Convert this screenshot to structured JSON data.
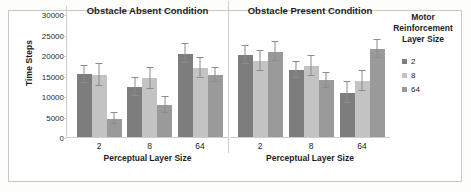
{
  "chart_data": {
    "type": "bar",
    "title": "",
    "xlabel": "Perceptual Layer Size",
    "ylabel": "Time Steps",
    "categories": [
      "2",
      "8",
      "64"
    ],
    "ylim": [
      0,
      30000
    ],
    "yticks": [
      0,
      5000,
      10000,
      15000,
      20000,
      25000,
      30000
    ],
    "ytick_labels": [
      "0",
      "5000",
      "10000",
      "15000",
      "20000",
      "25000",
      "30000"
    ],
    "grid": false,
    "legend_position": "right",
    "legend_title": "Motor Reinforcement Layer Size",
    "legend_title_lines": [
      "Motor",
      "Reinforcement",
      "Layer Size"
    ],
    "series_names": [
      "2",
      "8",
      "64"
    ],
    "series_colors": [
      "#7d7d7d",
      "#c3c3c3",
      "#9a9a9a"
    ],
    "error_bars": "standard deviation",
    "panels": [
      {
        "name": "obstacle-absent",
        "title": "Obstacle Absent Condition",
        "categories": [
          "2",
          "8",
          "64"
        ],
        "series": [
          {
            "name": "2",
            "values": [
              15300,
              12200,
              20300
            ],
            "errors": [
              2100,
              2100,
              2300
            ]
          },
          {
            "name": "8",
            "values": [
              15100,
              14300,
              16800
            ],
            "errors": [
              2600,
              2600,
              2500
            ]
          },
          {
            "name": "64",
            "values": [
              4500,
              7800,
              15100
            ],
            "errors": [
              1300,
              1900,
              1800
            ]
          }
        ]
      },
      {
        "name": "obstacle-present",
        "title": "Obstacle Present Condition",
        "categories": [
          "2",
          "8",
          "64"
        ],
        "series": [
          {
            "name": "2",
            "values": [
              20000,
              16400,
              10800
            ],
            "errors": [
              2100,
              2000,
              2600
            ]
          },
          {
            "name": "8",
            "values": [
              18600,
              17300,
              13600
            ],
            "errors": [
              2500,
              2500,
              2400
            ]
          },
          {
            "name": "64",
            "values": [
              20800,
              13800,
              21500
            ],
            "errors": [
              2300,
              1900,
              2200
            ]
          }
        ]
      }
    ]
  },
  "yaxis": {
    "title": "Time Steps",
    "labels": [
      "30000",
      "25000",
      "20000",
      "15000",
      "10000",
      "5000",
      "0"
    ]
  },
  "xaxis": {
    "title": "Perceptual Layer Size",
    "labels": [
      "2",
      "8",
      "64"
    ]
  },
  "panel_titles": {
    "absent": "Obstacle Absent Condition",
    "present": "Obstacle Present Condition"
  },
  "legend": {
    "title_line_1": "Motor",
    "title_line_2": "Reinforcement",
    "title_line_3": "Layer Size",
    "items": [
      {
        "label": "2",
        "color": "#7d7d7d"
      },
      {
        "label": "8",
        "color": "#c3c3c3"
      },
      {
        "label": "64",
        "color": "#9a9a9a"
      }
    ]
  }
}
